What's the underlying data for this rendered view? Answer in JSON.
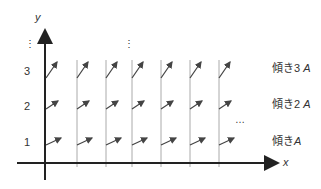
{
  "axes": {
    "x_label": "x",
    "y_label": "y"
  },
  "y_ticks": [
    "1",
    "2",
    "3"
  ],
  "slope_labels": [
    {
      "prefix": "傾き",
      "coef": "3",
      "var": "A"
    },
    {
      "prefix": "傾き",
      "coef": "2",
      "var": "A"
    },
    {
      "prefix": "傾き",
      "coef": "",
      "var": "A"
    }
  ],
  "ellipsis": {
    "vertical": "⋮",
    "horizontal": "…"
  },
  "colors": {
    "axis": "#222222",
    "grid": "#aaaaaa",
    "arrow": "#444444",
    "text": "#333333"
  }
}
